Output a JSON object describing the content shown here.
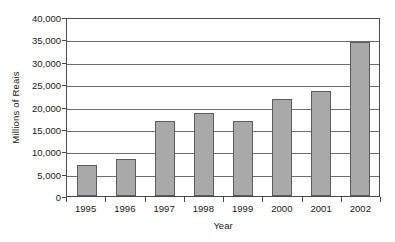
{
  "chart_data": {
    "type": "bar",
    "title": "",
    "xlabel": "Year",
    "ylabel": "Millions of Reais",
    "categories": [
      "1995",
      "1996",
      "1997",
      "1998",
      "1999",
      "2000",
      "2001",
      "2002"
    ],
    "values": [
      6900,
      8300,
      16800,
      18500,
      16800,
      21700,
      23500,
      34400
    ],
    "series": [
      {
        "name": "Millions of Reais",
        "values": [
          6900,
          8300,
          16800,
          18500,
          16800,
          21700,
          23500,
          34400
        ]
      }
    ],
    "ylim": [
      0,
      40000
    ],
    "ytick_values": [
      0,
      5000,
      10000,
      15000,
      20000,
      25000,
      30000,
      35000,
      40000
    ],
    "ytick_labels": [
      "0",
      "5,000",
      "10,000",
      "15,000",
      "20,000",
      "25,000",
      "30,000",
      "35,000",
      "40,000"
    ],
    "grid": true,
    "legend": false,
    "bar_color": "#a9a9a9",
    "bar_border_color": "#5c5c5c",
    "axis_color": "#4a4a4a",
    "gridline_color": "#6e6e6e"
  }
}
